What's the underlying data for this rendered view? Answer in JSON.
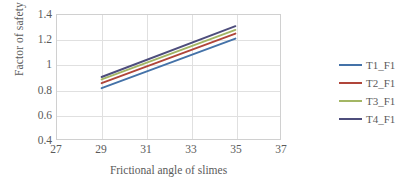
{
  "chart_data": {
    "type": "line",
    "title": "",
    "xlabel": "Frictional angle of slimes",
    "ylabel": "Factor of safety",
    "xlim": [
      27,
      37
    ],
    "ylim": [
      0.4,
      1.4
    ],
    "xticks": [
      "27",
      "29",
      "31",
      "33",
      "35",
      "37"
    ],
    "yticks": [
      "1.4",
      "1.2",
      "1",
      "0.8",
      "0.6",
      "0.4"
    ],
    "grid": true,
    "legend_position": "right",
    "x": [
      29,
      35
    ],
    "series": [
      {
        "name": "T1_F1",
        "color": "#4472A8",
        "values": [
          0.81,
          1.21
        ]
      },
      {
        "name": "T2_F1",
        "color": "#B0453A",
        "values": [
          0.85,
          1.25
        ]
      },
      {
        "name": "T3_F1",
        "color": "#A3B664",
        "values": [
          0.88,
          1.28
        ]
      },
      {
        "name": "T4_F1",
        "color": "#4D4D7C",
        "values": [
          0.9,
          1.31
        ]
      }
    ]
  },
  "axes": {
    "x_title": "Frictional angle of slimes",
    "y_title": "Factor of safety",
    "x_tick_labels": [
      "27",
      "29",
      "31",
      "33",
      "35",
      "37"
    ],
    "y_tick_labels": [
      "1.4",
      "1.2",
      "1",
      "0.8",
      "0.6",
      "0.4"
    ]
  },
  "legend": {
    "items": [
      {
        "label": "T1_F1",
        "color": "#4472A8"
      },
      {
        "label": "T2_F1",
        "color": "#B0453A"
      },
      {
        "label": "T3_F1",
        "color": "#A3B664"
      },
      {
        "label": "T4_F1",
        "color": "#4D4D7C"
      }
    ]
  }
}
